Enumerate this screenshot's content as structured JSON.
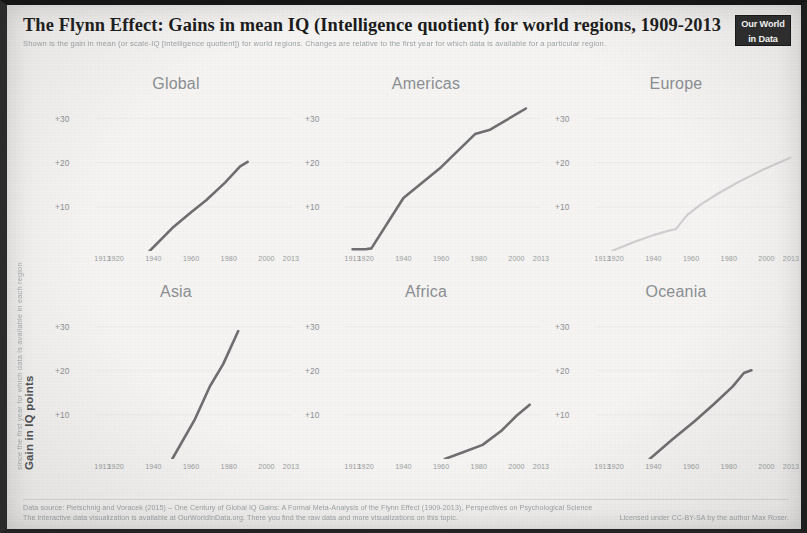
{
  "header": {
    "title": "The Flynn Effect: Gains in mean IQ (Intelligence quotient) for world regions, 1909-2013",
    "subtitle": "Shown is the gain in mean (or scale-IQ [Intelligence quotient]) for world regions. Changes are relative to the first year for which data is available for a particular region.",
    "logo_line1": "Our World",
    "logo_line2": "in Data"
  },
  "axis": {
    "y_label_main": "Gain in IQ points",
    "y_label_sub": "since the first year for which data is available in each region",
    "y_ticks": [
      "+30",
      "+20",
      "+10"
    ],
    "x_ticks": [
      "1913",
      "1920",
      "1940",
      "1960",
      "1980",
      "2000",
      "2013"
    ]
  },
  "footer": {
    "source": "Data source: Pietschnig and Voracek (2015) – One Century of Global IQ Gains: A Formal Meta-Analysis of the Flynn Effect (1909-2013), Perspectives on Psychological Science",
    "interactive": "The interactive data visualization is available at OurWorldInData.org. There you find the raw data and more visualizations on this topic.",
    "license": "Licensed under CC-BY-SA by the author Max Roser."
  },
  "style": {
    "line_color": "#6f6f72",
    "faint_line_color": "#cfcfd1",
    "title_color": "#1b1b1b",
    "panel_title_color": "#8b8f92",
    "background": "#f5f4f2",
    "logo_background": "#2a2a2a"
  },
  "chart_data": {
    "type": "line",
    "title": "The Flynn Effect: Gains in mean IQ (Intelligence quotient) for world regions, 1909-2013",
    "subtitle": "Shown is the gain in mean (or scale-IQ [Intelligence quotient]) for world regions. Changes are relative to the first year for which data is available for a particular region.",
    "xlabel": "",
    "ylabel": "Gain in IQ points",
    "xlim": [
      1909,
      2013
    ],
    "ylim": [
      0,
      34
    ],
    "xticks": [
      1913,
      1920,
      1940,
      1960,
      1980,
      2000,
      2013
    ],
    "yticks": [
      10,
      20,
      30
    ],
    "ytick_labels": [
      "+10",
      "+20",
      "+30"
    ],
    "grid": false,
    "legend": "none",
    "layout": "small-multiples 3 columns x 2 rows",
    "panels": [
      {
        "name": "Global",
        "row": 0,
        "col": 0,
        "emphasis": "normal",
        "x": [
          1938,
          1950,
          1960,
          1968,
          1978,
          1986,
          1990
        ],
        "y": [
          0.0,
          5.2,
          8.8,
          11.5,
          15.5,
          19.2,
          20.2
        ]
      },
      {
        "name": "Americas",
        "row": 0,
        "col": 1,
        "emphasis": "normal",
        "x": [
          1913,
          1920,
          1923,
          1940,
          1960,
          1978,
          1986,
          2005
        ],
        "y": [
          0.4,
          0.4,
          0.6,
          12.0,
          19.0,
          26.5,
          27.5,
          32.3
        ]
      },
      {
        "name": "Europe",
        "row": 0,
        "col": 2,
        "emphasis": "faint",
        "x": [
          1918,
          1930,
          1940,
          1948,
          1952,
          1958,
          1965,
          1975,
          1985,
          1998,
          2013
        ],
        "y": [
          0.0,
          2.1,
          3.6,
          4.6,
          5.0,
          8.2,
          10.5,
          13.2,
          15.6,
          18.4,
          21.2
        ]
      },
      {
        "name": "Asia",
        "row": 1,
        "col": 0,
        "emphasis": "normal",
        "x": [
          1950,
          1962,
          1970,
          1977,
          1985
        ],
        "y": [
          0.0,
          9.0,
          16.5,
          21.5,
          29.0
        ]
      },
      {
        "name": "Africa",
        "row": 1,
        "col": 1,
        "emphasis": "normal",
        "x": [
          1962,
          1972,
          1982,
          1992,
          2000,
          2007
        ],
        "y": [
          0.0,
          1.6,
          3.2,
          6.4,
          9.8,
          12.3
        ]
      },
      {
        "name": "Oceania",
        "row": 1,
        "col": 2,
        "emphasis": "normal",
        "x": [
          1938,
          1950,
          1962,
          1972,
          1982,
          1988,
          1992
        ],
        "y": [
          0.0,
          4.4,
          8.6,
          12.4,
          16.4,
          19.5,
          20.1
        ]
      }
    ]
  }
}
